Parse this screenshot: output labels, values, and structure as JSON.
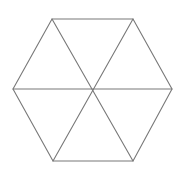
{
  "figure": {
    "name": "hexagon-with-diagonals",
    "canvas": {
      "width": 187,
      "height": 169,
      "background_color": "#ffffff"
    },
    "style": {
      "stroke_color": "#787878",
      "stroke_width": 1.1,
      "fill_color": "none"
    },
    "center": {
      "x": 93,
      "y": 89
    },
    "vertices": [
      {
        "name": "top-left",
        "x": 52,
        "y": 19
      },
      {
        "name": "top-right",
        "x": 133,
        "y": 19
      },
      {
        "name": "right",
        "x": 172,
        "y": 89
      },
      {
        "name": "bottom-right",
        "x": 133,
        "y": 161
      },
      {
        "name": "bottom-left",
        "x": 53,
        "y": 161
      },
      {
        "name": "left",
        "x": 13,
        "y": 89
      }
    ],
    "outline_points": "52,19 133,19 172,89 133,161 53,161 13,89",
    "diagonals": [
      {
        "name": "horizontal-diagonal",
        "x1": 13,
        "y1": 89,
        "x2": 172,
        "y2": 89
      },
      {
        "name": "top-left-bottom-right",
        "x1": 52,
        "y1": 19,
        "x2": 133,
        "y2": 161
      },
      {
        "name": "top-right-bottom-left",
        "x1": 133,
        "y1": 19,
        "x2": 53,
        "y2": 161
      }
    ],
    "triangle_count": 6
  }
}
